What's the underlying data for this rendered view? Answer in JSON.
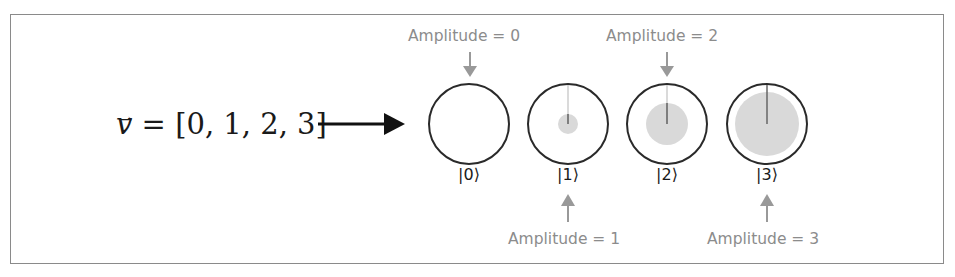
{
  "equation": {
    "vector_symbol": "v",
    "vector_arrow": "→",
    "rest": " = [0, 1, 2, 3]",
    "values": [
      0,
      1,
      2,
      3
    ]
  },
  "states": [
    {
      "ket": "|0⟩",
      "amplitude_label": "Amplitude = 0",
      "amplitude": 0,
      "label_position": "top"
    },
    {
      "ket": "|1⟩",
      "amplitude_label": "Amplitude = 1",
      "amplitude": 1,
      "label_position": "bottom"
    },
    {
      "ket": "|2⟩",
      "amplitude_label": "Amplitude = 2",
      "amplitude": 2,
      "label_position": "top"
    },
    {
      "ket": "|3⟩",
      "amplitude_label": "Amplitude = 3",
      "amplitude": 3,
      "label_position": "bottom"
    }
  ],
  "colors": {
    "circle_outline": "#2a2a2a",
    "amplitude_fill": "#d9d9d9",
    "label_gray": "#8c8c8c",
    "arrow_gray": "#999999",
    "main_arrow": "#111111"
  }
}
